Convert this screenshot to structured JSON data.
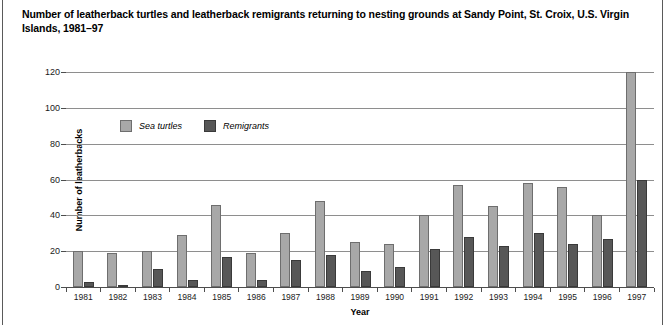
{
  "title": "Number of leatherback turtles and leatherback remigrants returning to nesting grounds at Sandy Point, St. Croix, U.S. Virgin Islands, 1981–97",
  "axes": {
    "xlabel": "Year",
    "ylabel": "Number of leatherbacks"
  },
  "legend": {
    "turtles_label": "Sea turtles",
    "remigrants_label": "Remigrants"
  },
  "colors": {
    "turtles_fill": "#a8a8a8",
    "turtles_stroke": "#6e6e6e",
    "remigrants_fill": "#575757",
    "remigrants_stroke": "#3a3a3a",
    "gridline": "#8e8e8e",
    "axis": "#4d4d4d"
  },
  "chart_data": {
    "type": "bar",
    "title": "Number of leatherback turtles and leatherback remigrants returning to nesting grounds at Sandy Point, St. Croix, U.S. Virgin Islands, 1981–97",
    "xlabel": "Year",
    "ylabel": "Number of leatherbacks",
    "ylim": [
      0,
      120
    ],
    "yticks": [
      0,
      20,
      40,
      60,
      80,
      100,
      120
    ],
    "grid": true,
    "legend_position": "inside-upper-left",
    "categories": [
      "1981",
      "1982",
      "1983",
      "1984",
      "1985",
      "1986",
      "1987",
      "1988",
      "1989",
      "1990",
      "1991",
      "1992",
      "1993",
      "1994",
      "1995",
      "1996",
      "1997"
    ],
    "series": [
      {
        "name": "Sea turtles",
        "values": [
          20,
          19,
          20,
          29,
          46,
          19,
          30,
          48,
          25,
          24,
          40,
          57,
          45,
          58,
          56,
          40,
          120
        ]
      },
      {
        "name": "Remigrants",
        "values": [
          3,
          1,
          10,
          4,
          17,
          4,
          15,
          18,
          9,
          11,
          21,
          28,
          23,
          30,
          24,
          27,
          60
        ]
      }
    ]
  }
}
